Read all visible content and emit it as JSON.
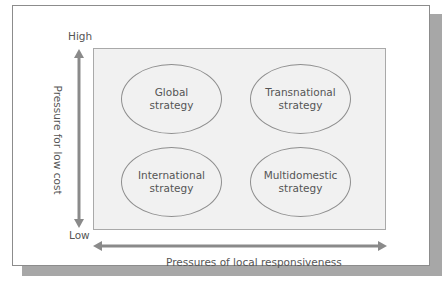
{
  "diagram": {
    "type": "2x2 strategy matrix",
    "y_axis": {
      "label": "Pressure for low cost",
      "high_label": "High",
      "low_label": "Low"
    },
    "x_axis": {
      "label": "Pressures of local responsiveness"
    },
    "quadrants": [
      {
        "position": "top-left",
        "line1": "Global",
        "line2": "strategy"
      },
      {
        "position": "top-right",
        "line1": "Transnational",
        "line2": "strategy"
      },
      {
        "position": "bottom-left",
        "line1": "International",
        "line2": "strategy"
      },
      {
        "position": "bottom-right",
        "line1": "Multidomestic",
        "line2": "strategy"
      }
    ],
    "colors": {
      "frame_border": "#8c8c8c",
      "shadow": "#a7a7a7",
      "matrix_fill": "#f1f1f1",
      "arrow": "#8a8a8a",
      "text": "#555555"
    }
  }
}
